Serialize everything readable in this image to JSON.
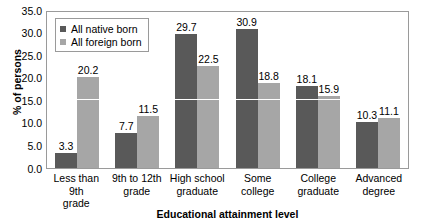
{
  "chart_data": {
    "type": "bar",
    "title": "",
    "xlabel": "Educational attainment level",
    "ylabel": "% of persons",
    "categories": [
      "Less than 9th grade",
      "9th to 12th grade",
      "High school graduate",
      "Some college",
      "College graduate",
      "Advanced degree"
    ],
    "category_lines": [
      [
        "Less than 9th",
        "grade"
      ],
      [
        "9th to 12th",
        "grade"
      ],
      [
        "High school",
        "graduate"
      ],
      [
        "Some",
        "college"
      ],
      [
        "College",
        "graduate"
      ],
      [
        "Advanced",
        "degree"
      ]
    ],
    "series": [
      {
        "name": "All native born",
        "color": "#595959",
        "values": [
          3.3,
          7.7,
          29.7,
          30.9,
          18.1,
          10.3
        ]
      },
      {
        "name": "All foreign born",
        "color": "#a6a6a6",
        "values": [
          20.2,
          11.5,
          22.5,
          18.8,
          15.9,
          11.1
        ]
      }
    ],
    "ylim": [
      0.0,
      35.0
    ],
    "ytick_step": 5.0,
    "yticks": [
      "0.0",
      "5.0",
      "10.0",
      "15.0",
      "20.0",
      "25.0",
      "30.0",
      "35.0"
    ],
    "grid": true,
    "gridline_values": [
      15.0
    ],
    "legend_position": "top-left",
    "data_labels": true
  },
  "legend": {
    "entries": [
      {
        "label": "All native born",
        "color": "#595959"
      },
      {
        "label": "All foreign born",
        "color": "#a6a6a6"
      }
    ]
  }
}
